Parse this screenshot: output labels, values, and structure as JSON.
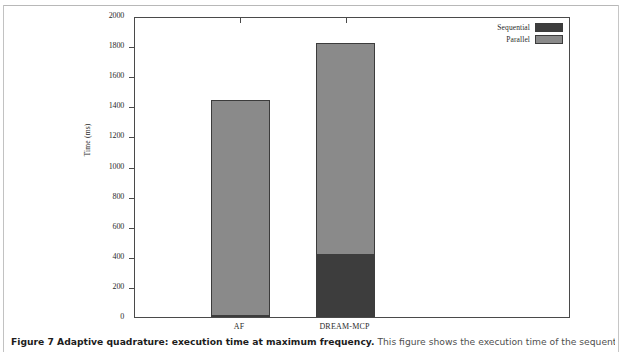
{
  "figure": {
    "caption_bold": "Figure 7 Adaptive quadrature: execution time at maximum frequency.",
    "caption_rest": " This figure shows the execution time of the sequential and parallel"
  },
  "legend": {
    "position": "top-right",
    "items": [
      {
        "label": "Sequential",
        "color": "#3d3d3d"
      },
      {
        "label": "Parallel",
        "color": "#8a8a8a"
      }
    ]
  },
  "axis": {
    "ylabel": "Time (ms)",
    "yticks": [
      0,
      200,
      400,
      600,
      800,
      1000,
      1200,
      1400,
      1600,
      1800,
      2000
    ],
    "ytick_labels": [
      "0",
      "200",
      "400",
      "600",
      "800",
      "1000",
      "1200",
      "1400",
      "1600",
      "1800",
      "2000"
    ],
    "ymin": 0,
    "ymax": 2000,
    "xlabel": ""
  },
  "chart_data": {
    "type": "bar",
    "stacked": true,
    "title": "",
    "xlabel": "",
    "ylabel": "Time (ms)",
    "ylim": [
      0,
      2000
    ],
    "grid": false,
    "legend_position": "top-right",
    "categories": [
      "AF",
      "DREAM-MCP"
    ],
    "series": [
      {
        "name": "Sequential",
        "color": "#3d3d3d",
        "values": [
          15,
          420
        ]
      },
      {
        "name": "Parallel",
        "color": "#8a8a8a",
        "values": [
          1425,
          1400
        ]
      }
    ],
    "totals": [
      1440,
      1820
    ],
    "annotations": []
  }
}
